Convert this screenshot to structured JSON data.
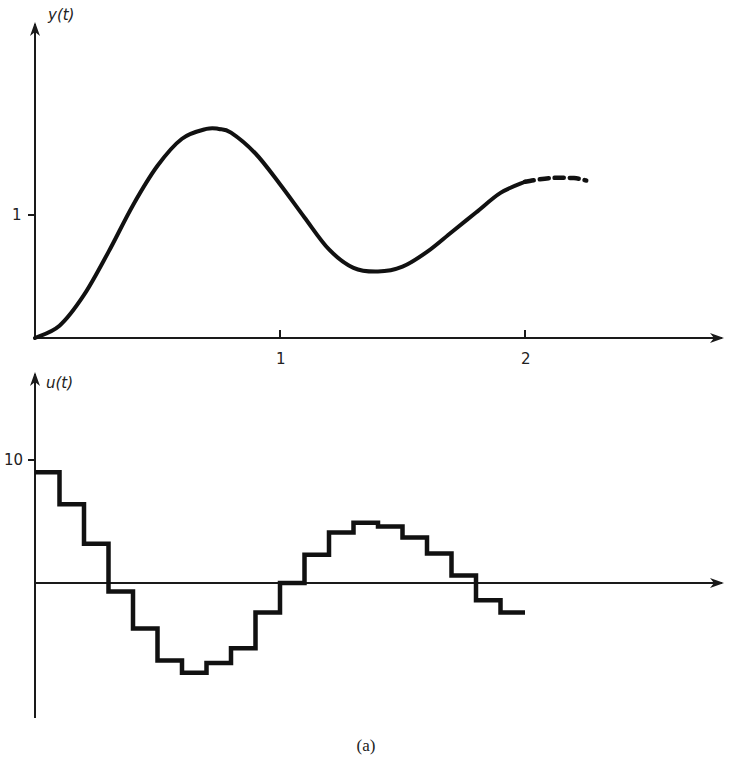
{
  "caption": "(a)",
  "chart_data": [
    {
      "type": "line",
      "panel": "top",
      "ylabel": "y(t)",
      "xlabel": "",
      "xticks": [
        {
          "value": 1,
          "label": "1"
        },
        {
          "value": 2,
          "label": "2"
        }
      ],
      "yticks": [
        {
          "value": 1,
          "label": "1"
        }
      ],
      "xlim": [
        0,
        2.85
      ],
      "ylim": [
        0,
        2.4
      ],
      "grid": false,
      "series": [
        {
          "name": "y(t) solid",
          "style": "solid",
          "x": [
            0,
            0.1,
            0.2,
            0.3,
            0.4,
            0.5,
            0.6,
            0.7,
            0.75,
            0.8,
            0.9,
            1.0,
            1.1,
            1.2,
            1.3,
            1.4,
            1.5,
            1.6,
            1.7,
            1.8,
            1.9,
            2.0
          ],
          "y": [
            0,
            0.1,
            0.35,
            0.7,
            1.08,
            1.4,
            1.62,
            1.7,
            1.7,
            1.67,
            1.5,
            1.25,
            0.98,
            0.72,
            0.57,
            0.54,
            0.58,
            0.7,
            0.86,
            1.02,
            1.18,
            1.27
          ]
        },
        {
          "name": "y(t) continuation",
          "style": "dashed",
          "x": [
            2.0,
            2.1,
            2.2,
            2.25
          ],
          "y": [
            1.27,
            1.3,
            1.3,
            1.28
          ]
        }
      ]
    },
    {
      "type": "step",
      "panel": "bottom",
      "ylabel": "u(t)",
      "xlabel": "",
      "yticks": [
        {
          "value": 10,
          "label": "10"
        }
      ],
      "step_width": 0.1,
      "xlim": [
        0,
        2.85
      ],
      "ylim": [
        -11,
        17
      ],
      "grid": false,
      "series": [
        {
          "name": "u(t)",
          "x_start": [
            0,
            0.1,
            0.2,
            0.3,
            0.4,
            0.5,
            0.6,
            0.7,
            0.8,
            0.9,
            1.0,
            1.1,
            1.2,
            1.3,
            1.4,
            1.5,
            1.6,
            1.7,
            1.8,
            1.9
          ],
          "values": [
            9.0,
            6.4,
            3.2,
            -0.7,
            -3.7,
            -6.3,
            -7.3,
            -6.5,
            -5.3,
            -2.4,
            0.0,
            2.3,
            4.1,
            4.9,
            4.6,
            3.7,
            2.4,
            0.6,
            -1.4,
            -2.4
          ]
        }
      ]
    }
  ]
}
